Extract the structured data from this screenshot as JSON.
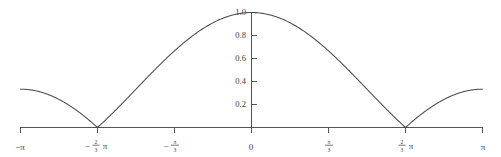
{
  "chart_data": {
    "type": "line",
    "title": "",
    "subtitle": "",
    "xlabel": "",
    "ylabel": "",
    "grid": false,
    "legend": null,
    "xlim": [
      -3.14159265,
      3.14159265
    ],
    "ylim": [
      0,
      1.05
    ],
    "x_tick_labels": [
      "-π",
      "-(2/3)π",
      "-π/3",
      "0",
      "π/3",
      "(2/3)π",
      "π"
    ],
    "x_tick_values": [
      -3.14159265,
      -2.0943951,
      -1.04719755,
      0,
      1.04719755,
      2.0943951,
      3.14159265
    ],
    "y_tick_labels": [
      "1.0",
      "0.8",
      "0.6",
      "0.4",
      "0.2"
    ],
    "y_tick_values": [
      1.0,
      0.8,
      0.6,
      0.4,
      0.2
    ],
    "axis_color": "#545454",
    "curve_color": "#4a4a4a",
    "background_color": "#ffffff",
    "series": [
      {
        "name": "|D(x)|",
        "description": "Magnitude of Dirichlet-type kernel, main lobe at x=0 with value 1.0, zeros at +/-pi/3 and +/-2pi/3, side lobes peaking near 0.23 and 0.18",
        "zeros": [
          -2.0943951,
          -1.04719755,
          1.04719755,
          2.0943951
        ],
        "peaks": [
          {
            "x": -2.618,
            "y": 0.18
          },
          {
            "x": -1.571,
            "y": 0.235
          },
          {
            "x": 0.0,
            "y": 1.0
          },
          {
            "x": 1.571,
            "y": 0.235
          },
          {
            "x": 2.618,
            "y": 0.18
          }
        ],
        "endpoints": [
          {
            "x": -3.14159265,
            "y": 0.0
          },
          {
            "x": 3.14159265,
            "y": 0.0
          }
        ],
        "x": [
          -3.14159265,
          -3.0543262,
          -2.9670597,
          -2.8797933,
          -2.7925268,
          -2.7052603,
          -2.6179939,
          -2.5307274,
          -2.443461,
          -2.3561945,
          -2.268928,
          -2.1816616,
          -2.0943951,
          -2.0071286,
          -1.9198622,
          -1.8325957,
          -1.7453293,
          -1.6580628,
          -1.5707963,
          -1.4835299,
          -1.3962634,
          -1.3089969,
          -1.2217305,
          -1.134464,
          -1.0471976,
          -0.9599311,
          -0.8726646,
          -0.7853982,
          -0.6981317,
          -0.6108652,
          -0.5235988,
          -0.4363323,
          -0.3490659,
          -0.2617994,
          -0.1745329,
          -0.0872665,
          0.0,
          0.0872665,
          0.1745329,
          0.2617994,
          0.3490659,
          0.4363323,
          0.5235988,
          0.6108652,
          0.6981317,
          0.7853982,
          0.8726646,
          0.9599311,
          1.0471976,
          1.134464,
          1.2217305,
          1.3089969,
          1.3962634,
          1.4835299,
          1.5707963,
          1.6580628,
          1.7453293,
          1.8325957,
          1.9198622,
          2.0071286,
          2.0943951,
          2.1816616,
          2.268928,
          2.3561945,
          2.443461,
          2.5307274,
          2.6179939,
          2.7052603,
          2.7925268,
          2.8797933,
          2.9670597,
          3.0543262,
          3.14159265
        ],
        "y": [
          0.0,
          0.0345,
          0.0681,
          0.1,
          0.1295,
          0.1558,
          0.1782,
          0.1962,
          0.2094,
          0.2174,
          0.2199,
          0.217,
          0.0,
          0.0353,
          0.0739,
          0.1137,
          0.1529,
          0.1894,
          0.2213,
          0.2469,
          0.2648,
          0.2739,
          0.2737,
          0.2639,
          0.0,
          0.0559,
          0.1208,
          0.1925,
          0.2686,
          0.3465,
          0.4236,
          0.4976,
          0.5662,
          0.6275,
          0.68,
          0.7222,
          1.0,
          0.7222,
          0.68,
          0.6275,
          0.5662,
          0.4976,
          0.4236,
          0.3465,
          0.2686,
          0.1925,
          0.1208,
          0.0559,
          0.0,
          0.2639,
          0.2737,
          0.2739,
          0.2648,
          0.2469,
          0.2213,
          0.1894,
          0.1529,
          0.1137,
          0.0739,
          0.0353,
          0.0,
          0.217,
          0.2199,
          0.2174,
          0.2094,
          0.1962,
          0.1782,
          0.1558,
          0.1295,
          0.1,
          0.0681,
          0.0345,
          0.0
        ]
      }
    ]
  },
  "axis": {
    "y_labels": [
      "1.0",
      "0.8",
      "0.6",
      "0.4",
      "0.2"
    ],
    "x_label_origin": "0",
    "x_label_neg_pi": "−π",
    "x_label_pos_pi": "π",
    "pi_symbol": "π",
    "minus_symbol": "−",
    "frac_two": "2",
    "frac_three": "3",
    "frac_one_num": "π",
    "frac_one_den": "3"
  }
}
